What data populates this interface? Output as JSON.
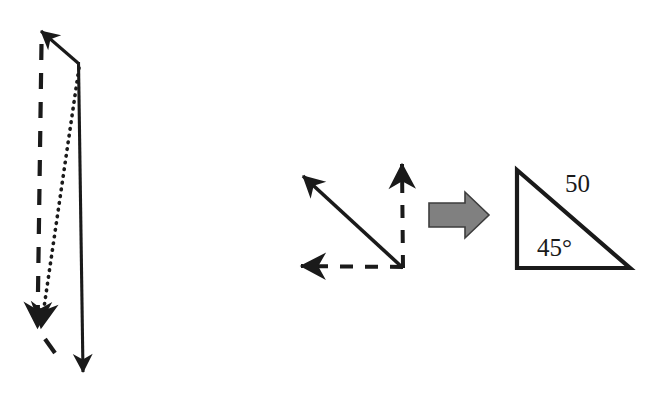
{
  "figure": {
    "background_color": "#ffffff",
    "stroke_color": "#1a1a1a",
    "gray_arrow_color": "#808080",
    "gray_arrow_outline": "#3d3d3d",
    "panels": [
      {
        "name": "left-vector-parallelogram",
        "description": "Two component arrows (solid down, dashed up-left) with dotted resultant"
      },
      {
        "name": "middle-vector-axes",
        "description": "Solid diagonal arrow up-left with dashed vertical and dashed horizontal components"
      },
      {
        "name": "right-triangle",
        "description": "Right triangle with hypotenuse labeled 50 and base angle 45 degrees"
      }
    ]
  },
  "left_diagram": {
    "name": "left-vector-diagram",
    "solid_arrow": {
      "name": "solid-down-arrow",
      "from": [
        78,
        62
      ],
      "to": [
        83,
        378
      ],
      "direction": "down",
      "style": "solid"
    },
    "solid_upleft_arrow": {
      "name": "solid-upleft-arrow",
      "from": [
        78,
        62
      ],
      "to": [
        38,
        28
      ],
      "direction": "up-left",
      "style": "solid"
    },
    "dashed_arrow": {
      "name": "dashed-downleft-arrow",
      "from": [
        41,
        40
      ],
      "to": [
        37,
        330
      ],
      "direction": "down-left",
      "style": "dashed"
    },
    "dashed_tail": {
      "name": "dashed-tail-segment",
      "from": [
        44,
        338
      ],
      "to": [
        54,
        352
      ]
    },
    "dotted_arrow": {
      "name": "dotted-resultant-arrow",
      "from": [
        79,
        68
      ],
      "to": [
        39,
        332
      ],
      "direction": "down-left",
      "style": "dotted"
    }
  },
  "middle_diagram": {
    "name": "middle-vector-diagram",
    "origin": [
      403,
      268
    ],
    "solid_diagonal_arrow": {
      "name": "solid-diagonal-arrow",
      "from": [
        403,
        268
      ],
      "to": [
        297,
        171
      ],
      "direction": "up-left",
      "style": "solid"
    },
    "dashed_vertical_arrow": {
      "name": "dashed-vertical-arrow",
      "from": [
        403,
        268
      ],
      "to": [
        402,
        157
      ],
      "direction": "up",
      "style": "dashed"
    },
    "dashed_horizontal_arrow": {
      "name": "dashed-horizontal-arrow",
      "from": [
        403,
        268
      ],
      "to": [
        294,
        266
      ],
      "direction": "left",
      "style": "dashed"
    }
  },
  "transform_arrow": {
    "name": "gray-block-arrow-right",
    "direction": "right",
    "fill": "#808080",
    "outline": "#3d3d3d",
    "bounds": [
      428,
      193,
      60,
      44
    ]
  },
  "right_triangle": {
    "name": "right-triangle-shape",
    "vertices": {
      "top_left": [
        517,
        170
      ],
      "bottom_left": [
        517,
        268
      ],
      "bottom_right": [
        630,
        268
      ]
    },
    "labels": {
      "hypotenuse": "50",
      "angle": "45°"
    },
    "label_positions": {
      "hypotenuse": [
        565,
        192
      ],
      "angle": [
        537,
        255
      ]
    },
    "font_sizes": {
      "hypotenuse": 25,
      "angle": 25
    }
  }
}
